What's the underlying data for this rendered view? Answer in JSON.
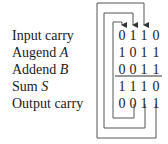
{
  "diagram": {
    "rows": [
      {
        "label": "Input carry",
        "var": "",
        "bits": [
          "0",
          "1",
          "1",
          "0"
        ]
      },
      {
        "label": "Augend ",
        "var": "A",
        "bits": [
          "1",
          "0",
          "1",
          "1"
        ]
      },
      {
        "label": "Addend ",
        "var": "B",
        "bits": [
          "0",
          "0",
          "1",
          "1"
        ]
      },
      {
        "label": "Sum ",
        "var": "S",
        "bits": [
          "1",
          "1",
          "1",
          "0"
        ]
      },
      {
        "label": "Output carry",
        "var": "",
        "bits": [
          "0",
          "0",
          "1",
          "1"
        ]
      }
    ],
    "carry_arrows": [
      {
        "from_column": 1,
        "to_column": 0,
        "description": "output carry of column 1 feeds input carry of column 0"
      },
      {
        "from_column": 2,
        "to_column": 1,
        "description": "output carry of column 2 feeds input carry of column 1"
      },
      {
        "from_column": 3,
        "to_column": 2,
        "description": "output carry of column 3 feeds input carry of column 2"
      }
    ],
    "line_color": "#555555",
    "text_color": "#1a1a1a"
  }
}
